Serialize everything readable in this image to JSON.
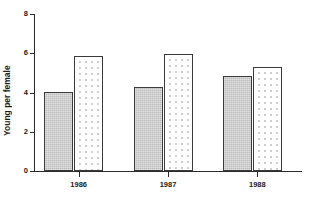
{
  "chart_data": {
    "type": "bar",
    "title": "",
    "xlabel": "",
    "ylabel": "Young per female",
    "categories": [
      "1986",
      "1987",
      "1988"
    ],
    "ylim": [
      0,
      8
    ],
    "yticks": [
      0,
      2,
      4,
      6,
      8
    ],
    "ytick_labels": [
      "0",
      "2",
      "4",
      "6",
      "8"
    ],
    "grid": false,
    "legend": "none",
    "series": [
      {
        "name": "solid-gray-bar",
        "fill": "solid-gray",
        "color": "#c6c6c6",
        "values": [
          4.05,
          4.3,
          4.85
        ]
      },
      {
        "name": "dotted-bar",
        "fill": "dotted",
        "color": "#ffffff",
        "values": [
          5.85,
          5.95,
          5.3
        ]
      }
    ]
  },
  "axes": {
    "line_color": "#2b2b2b",
    "bar_border_color": "#3a3a3a"
  }
}
